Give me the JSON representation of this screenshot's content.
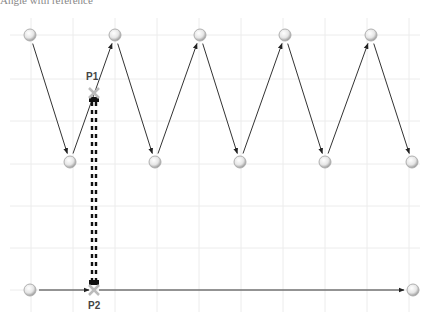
{
  "caption": "Angle with reference",
  "grid": {
    "color": "#ececec",
    "vertical_x": [
      31,
      73,
      115,
      157,
      199,
      241,
      283,
      325,
      367,
      409
    ],
    "horizontal_y": [
      35,
      79,
      121,
      164,
      206,
      248,
      290
    ]
  },
  "zigzag_nodes": [
    {
      "x": 30,
      "y": 35
    },
    {
      "x": 70,
      "y": 162
    },
    {
      "x": 115,
      "y": 35
    },
    {
      "x": 155,
      "y": 162
    },
    {
      "x": 200,
      "y": 35
    },
    {
      "x": 240,
      "y": 162
    },
    {
      "x": 285,
      "y": 35
    },
    {
      "x": 325,
      "y": 162
    },
    {
      "x": 371,
      "y": 35
    },
    {
      "x": 412,
      "y": 162
    }
  ],
  "bottom_line": {
    "start": {
      "x": 30,
      "y": 290
    },
    "end": {
      "x": 413,
      "y": 290
    }
  },
  "points": [
    {
      "label": "P1",
      "x": 94,
      "y": 93,
      "label_x": 86,
      "label_y": 80
    },
    {
      "label": "P2",
      "x": 94,
      "y": 290,
      "label_x": 88,
      "label_y": 309
    }
  ],
  "colors": {
    "line": "#333333",
    "dashed": "#111111",
    "marker": "#bbbbbb"
  }
}
